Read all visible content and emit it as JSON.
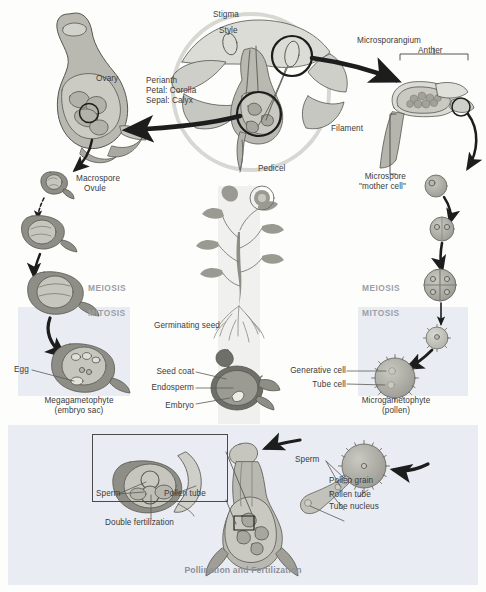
{
  "figure": {
    "caption": "Pollination and Fertilization"
  },
  "colors": {
    "panel_shade": "#e9ecf2",
    "text": "#3b3b3b",
    "phase_text": "#9b9fa6",
    "caption_text": "#8c9097",
    "tissue_light": "#d2d2cc",
    "tissue_mid": "#b9b9b2",
    "tissue_dark": "#8e8e87",
    "tissue_darker": "#6f6f69",
    "outline": "#55554f",
    "arrow": "#1d1d1d"
  },
  "phases": {
    "left_meiosis": "MEIOSIS",
    "left_mitosis": "MITOSIS",
    "right_meiosis": "MEIOSIS",
    "right_mitosis": "MITOSIS"
  },
  "female_track": {
    "ovary": "Ovary",
    "macrospore": "Macrospore",
    "ovule": "Ovule",
    "egg": "Egg",
    "megagametophyte_line1": "Megagametophyte",
    "megagametophyte_line2": "(embryo sac)"
  },
  "flower": {
    "stigma": "Stigma",
    "style": "Style",
    "perianth": "Perianth",
    "petal": "Petal: Corolla",
    "sepal": "Sepal: Calyx",
    "filament": "Filament",
    "pedicel": "Pedicel"
  },
  "male_track": {
    "microsporangium": "Microsporangium",
    "anther": "Anther",
    "microspore_line1": "Microspore",
    "microspore_line2": "\"mother cell\"",
    "generative_cell": "Generative cell",
    "tube_cell": "Tube cell",
    "microgametophyte_line1": "Microgametophyte",
    "microgametophyte_line2": "(pollen)"
  },
  "sporophyte": {
    "germinating_seed": "Germinating seed",
    "seed_coat": "Seed coat",
    "endosperm": "Endosperm",
    "embryo": "Embryo"
  },
  "fertilization": {
    "inset_sperm": "Sperm",
    "inset_pollen_tube": "Pollen tube",
    "double_fertilization": "Double fertilization",
    "sperm": "Sperm",
    "pollen_grain": "Pollen grain",
    "pollen_tube": "Pollen tube",
    "tube_nucleus": "Tube nucleus"
  }
}
